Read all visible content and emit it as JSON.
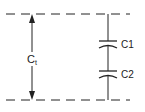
{
  "diagram": {
    "total_label": "C",
    "total_subscript": "t",
    "capacitors": [
      {
        "label": "C1"
      },
      {
        "label": "C2"
      }
    ],
    "stroke_color": "#222222"
  }
}
